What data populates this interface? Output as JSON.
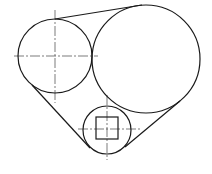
{
  "diagram": {
    "stroke_color": "#1a1a1a",
    "background": "#ffffff",
    "shapes": {
      "left_circle": {
        "cx": 55,
        "cy": 56,
        "r": 37
      },
      "big_circle": {
        "cx": 146,
        "cy": 59,
        "r": 54
      },
      "small_circle": {
        "cx": 107,
        "cy": 130,
        "r": 24
      },
      "square": {
        "x": 96,
        "y": 117,
        "w": 22,
        "h": 22
      },
      "tangent_top": {
        "x1": 55,
        "y1": 19,
        "x2": 142,
        "y2": 5
      },
      "tangent_left": {
        "x1": 32,
        "y1": 85,
        "x2": 90,
        "y2": 148
      },
      "tangent_right": {
        "x1": 180,
        "y1": 101,
        "x2": 125,
        "y2": 147
      }
    }
  }
}
